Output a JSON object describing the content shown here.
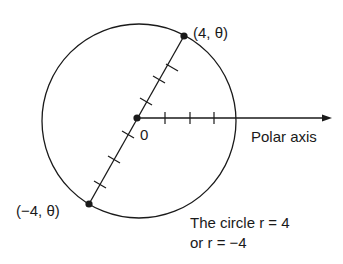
{
  "diagram": {
    "point_positive": "(4, θ)",
    "point_negative": "(−4, θ)",
    "origin_label": "0",
    "axis_label": "Polar axis",
    "caption_line1": "The circle r = 4",
    "caption_line2": "or r = −4",
    "colors": {
      "ink": "#1a1a1a",
      "background": "#ffffff"
    }
  }
}
